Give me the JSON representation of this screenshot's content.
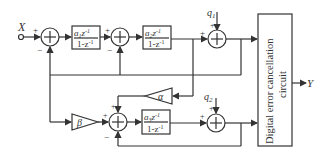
{
  "diagram": {
    "input": {
      "label": "X"
    },
    "output": {
      "label": "Y"
    },
    "signs": {
      "plus": "+",
      "minus": "−"
    },
    "stage1": {
      "sum1": {
        "symbol": "+"
      },
      "block1": {
        "num_coef": "a",
        "num_sub": "1",
        "num_z": "z",
        "num_exp": "-1",
        "den": "1-z",
        "den_exp": "-1"
      },
      "sum2": {
        "symbol": "+"
      },
      "block2": {
        "num_coef": "a",
        "num_sub": "2",
        "num_z": "z",
        "num_exp": "-1",
        "den": "1-z",
        "den_exp": "-1"
      },
      "quantizer_noise": {
        "label": "q",
        "sub": "1"
      },
      "sum3": {
        "symbol": "+"
      }
    },
    "stage2": {
      "alpha": {
        "label": "α"
      },
      "beta": {
        "label": "β"
      },
      "sum4": {
        "symbol": "+"
      },
      "block3": {
        "num_coef": "a",
        "num_sub": "3",
        "num_z": "z",
        "num_exp": "-1",
        "den": "1-z",
        "den_exp": "-1"
      },
      "quantizer_noise": {
        "label": "q",
        "sub": "2"
      },
      "sum5": {
        "symbol": "+"
      }
    },
    "cancellation_block": {
      "line1": "Digital error cancellation",
      "line2": "circuit"
    }
  }
}
